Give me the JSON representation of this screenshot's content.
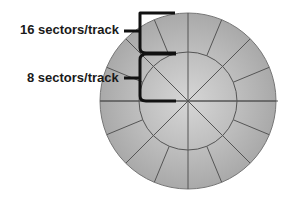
{
  "diagram": {
    "labels": {
      "outer": "16 sectors/track",
      "inner": "8 sectors/track"
    },
    "disk": {
      "center": [
        188,
        101
      ],
      "outer_radius": 88,
      "inner_radius": 49,
      "outer_track_sectors": 16,
      "inner_track_sectors": 8,
      "colors": {
        "fill_center": "#d4d4d4",
        "fill_edge": "#aaaaaa",
        "line": "#555555",
        "bracket": "#111111"
      }
    }
  }
}
